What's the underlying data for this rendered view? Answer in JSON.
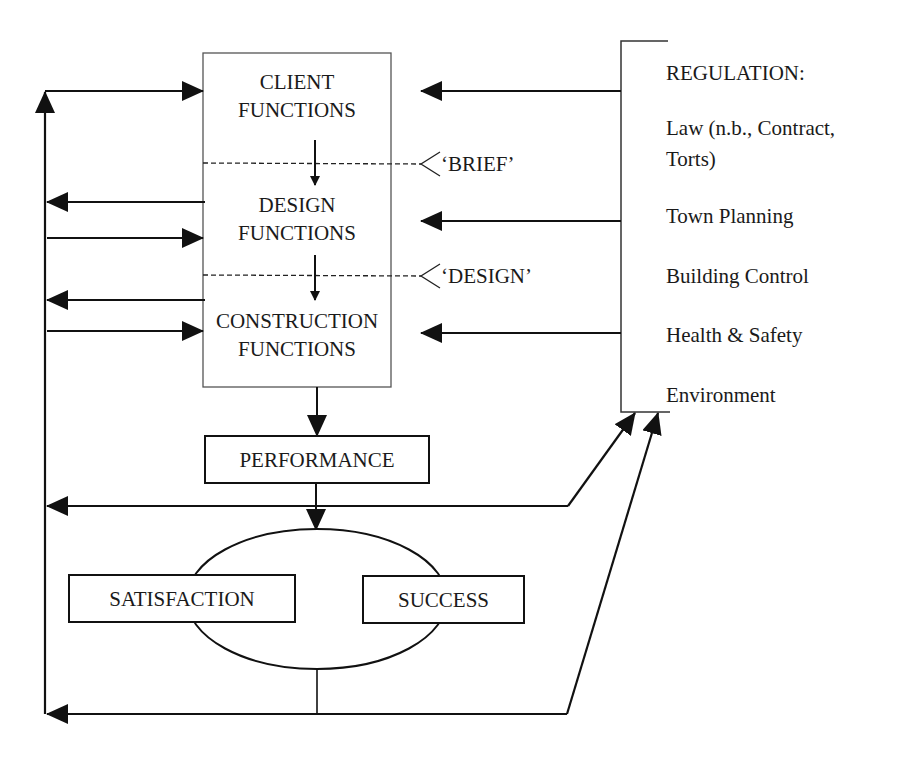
{
  "diagram": {
    "stages": [
      {
        "line1": "CLIENT",
        "line2": "FUNCTIONS"
      },
      {
        "line1": "DESIGN",
        "line2": "FUNCTIONS"
      },
      {
        "line1": "CONSTRUCTION",
        "line2": "FUNCTIONS"
      }
    ],
    "milestones": [
      "‘BRIEF’",
      "‘DESIGN’"
    ],
    "performance": "PERFORMANCE",
    "outcomes": {
      "satisfaction": "SATISFACTION",
      "success": "SUCCESS"
    },
    "regulation": {
      "title": "REGULATION:",
      "items": [
        "Law (n.b., Contract,",
        "Torts)",
        "Town Planning",
        "Building Control",
        "Health & Safety",
        "Environment"
      ]
    }
  }
}
